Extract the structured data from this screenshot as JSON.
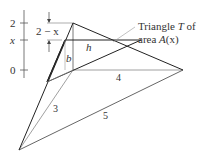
{
  "axis": {
    "ticks": [
      {
        "label": "2",
        "y": 23
      },
      {
        "label": "x",
        "y": 40
      },
      {
        "label": "0",
        "y": 70
      }
    ]
  },
  "dimension": {
    "label": "2 − x"
  },
  "labels": {
    "h": "h",
    "b": "b",
    "edge_4": "4",
    "edge_3": "3",
    "edge_5": "5"
  },
  "callout": {
    "line1_prefix": "Triangle ",
    "line1_var": "T",
    "line1_suffix": " of",
    "line2_prefix": "area ",
    "line2_var": "A",
    "line2_suffix": "(x)"
  },
  "colors": {
    "stroke_dark": "#222222",
    "stroke_light": "#777777",
    "text": "#333333"
  }
}
